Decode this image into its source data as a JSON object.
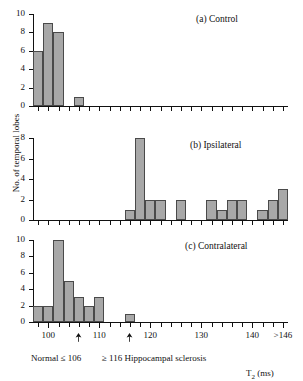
{
  "figure": {
    "ylabel": "No. of temporal lobes",
    "xlabel_main": "T",
    "xlabel_sub": "2",
    "xlabel_unit": " (ms)"
  },
  "axis": {
    "x_min": 97,
    "x_max": 147,
    "x_tick_step": 2,
    "x_tick_labels": [
      {
        "value": 100,
        "text": "100"
      },
      {
        "value": 110,
        "text": "110"
      },
      {
        "value": 120,
        "text": "120"
      },
      {
        "value": 130,
        "text": "130"
      },
      {
        "value": 140,
        "text": "140"
      },
      {
        "value": 146,
        "text": ">146"
      }
    ],
    "y_ticks_10": [
      "0",
      "2",
      "4",
      "6",
      "8",
      "10"
    ],
    "y_ticks_8": [
      "0",
      "2",
      "4",
      "6",
      "8"
    ]
  },
  "annotations": {
    "arrow1_value": 106,
    "arrow2_value": 116,
    "normal_label": "Normal ≤ 106",
    "sclerosis_label": "≥ 116 Hippocampal sclerosis"
  },
  "chart_data": [
    {
      "type": "bar",
      "title": "(a) Control",
      "xlabel": "T2 (ms)",
      "ylabel": "No. of temporal lobes",
      "xlim": [
        97,
        147
      ],
      "ylim": [
        0,
        10
      ],
      "bin_width": 2,
      "yticks": [
        0,
        2,
        4,
        6,
        8,
        10
      ],
      "grid": false,
      "legend": "none",
      "categories": [
        98,
        100,
        102,
        104,
        106,
        108,
        110,
        112,
        114,
        116,
        118,
        120,
        122,
        124,
        126,
        128,
        130,
        132,
        134,
        136,
        138,
        140,
        142,
        144,
        146
      ],
      "values": [
        6,
        9,
        8,
        0,
        1,
        0,
        0,
        0,
        0,
        0,
        0,
        0,
        0,
        0,
        0,
        0,
        0,
        0,
        0,
        0,
        0,
        0,
        0,
        0,
        0
      ]
    },
    {
      "type": "bar",
      "title": "(b) Ipsilateral",
      "xlabel": "T2 (ms)",
      "ylabel": "No. of temporal lobes",
      "xlim": [
        97,
        147
      ],
      "ylim": [
        0,
        8
      ],
      "bin_width": 2,
      "yticks": [
        0,
        2,
        4,
        6,
        8
      ],
      "grid": false,
      "legend": "none",
      "categories": [
        98,
        100,
        102,
        104,
        106,
        108,
        110,
        112,
        114,
        116,
        118,
        120,
        122,
        124,
        126,
        128,
        130,
        132,
        134,
        136,
        138,
        140,
        142,
        144,
        146
      ],
      "values": [
        0,
        0,
        0,
        0,
        0,
        0,
        0,
        0,
        0,
        1,
        8,
        2,
        2,
        0,
        2,
        0,
        0,
        2,
        1,
        2,
        2,
        0,
        1,
        2,
        3
      ]
    },
    {
      "type": "bar",
      "title": "(c) Contralateral",
      "xlabel": "T2 (ms)",
      "ylabel": "No. of temporal lobes",
      "xlim": [
        97,
        147
      ],
      "ylim": [
        0,
        10
      ],
      "bin_width": 2,
      "yticks": [
        0,
        2,
        4,
        6,
        8,
        10
      ],
      "grid": false,
      "legend": "none",
      "categories": [
        98,
        100,
        102,
        104,
        106,
        108,
        110,
        112,
        114,
        116,
        118,
        120,
        122,
        124,
        126,
        128,
        130,
        132,
        134,
        136,
        138,
        140,
        142,
        144,
        146
      ],
      "values": [
        2,
        2,
        10,
        5,
        3,
        2,
        3,
        0,
        0,
        1,
        0,
        0,
        0,
        0,
        0,
        0,
        0,
        0,
        0,
        0,
        0,
        0,
        0,
        0,
        0
      ]
    }
  ]
}
